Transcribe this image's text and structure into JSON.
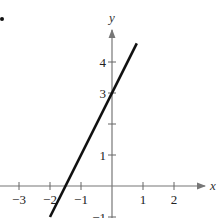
{
  "chart_data": {
    "type": "line",
    "title": "",
    "xlabel": "x",
    "ylabel": "y",
    "xlim": [
      -3.5,
      2.8
    ],
    "ylim": [
      -1,
      4.7
    ],
    "grid": false,
    "x_ticks": [
      -3,
      -2,
      -1,
      1,
      2
    ],
    "y_ticks": [
      -1,
      1,
      2,
      3,
      4
    ],
    "x_tick_labels": [
      "−3",
      "−2",
      "−1",
      "1",
      "2"
    ],
    "y_tick_labels": [
      "−1",
      "1",
      "",
      "3",
      "4"
    ],
    "series": [
      {
        "name": "y = 2x + 3",
        "x": [
          -2,
          0.8
        ],
        "y": [
          -1,
          4.6
        ]
      }
    ],
    "annotations": [
      "bullet marker at top-left"
    ]
  },
  "labels": {
    "x_axis": "x",
    "y_axis": "y"
  }
}
